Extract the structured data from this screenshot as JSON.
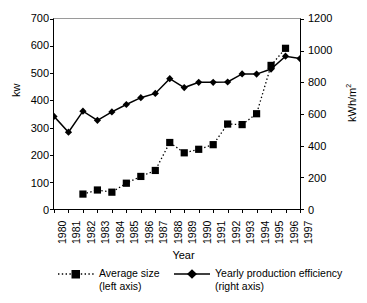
{
  "chart_data": {
    "type": "line",
    "title": "",
    "xlabel": "Year",
    "ylabel": "kw",
    "ylabel_right": "kWh/m2",
    "ylabel_right_base": "kWh/m",
    "ylabel_right_sup": "2",
    "grid": false,
    "legend_position": "bottom",
    "categories": [
      "1980",
      "1981",
      "1982",
      "1983",
      "1984",
      "1985",
      "1986",
      "1987",
      "1988",
      "1989",
      "1990",
      "1991",
      "1992",
      "1993",
      "1994",
      "1995",
      "1996",
      "1997"
    ],
    "x": [
      1980,
      1981,
      1982,
      1983,
      1984,
      1985,
      1986,
      1987,
      1988,
      1989,
      1990,
      1991,
      1992,
      1993,
      1994,
      1995,
      1996,
      1997
    ],
    "ylim": [
      0,
      700
    ],
    "yticks": [
      0,
      100,
      200,
      300,
      400,
      500,
      600,
      700
    ],
    "ylim_right": [
      0,
      1200
    ],
    "yticks_right": [
      0,
      200,
      400,
      600,
      800,
      1000,
      1200
    ],
    "series": [
      {
        "name": "Average size",
        "axis": "left",
        "axis_note": "(left axis)",
        "marker": "square",
        "linestyle": "dotted",
        "color": "#000000",
        "x": [
          1982,
          1983,
          1984,
          1985,
          1986,
          1987,
          1988,
          1989,
          1990,
          1991,
          1992,
          1993,
          1994,
          1995,
          1996
        ],
        "values": [
          55,
          70,
          62,
          95,
          120,
          142,
          245,
          207,
          220,
          237,
          313,
          311,
          351,
          529,
          592
        ]
      },
      {
        "name": "Yearly production efficiency",
        "axis": "right",
        "axis_note": "(right axis)",
        "marker": "diamond",
        "linestyle": "solid",
        "color": "#000000",
        "x": [
          1980,
          1981,
          1982,
          1983,
          1984,
          1985,
          1986,
          1987,
          1988,
          1989,
          1990,
          1991,
          1992,
          1993,
          1994,
          1995,
          1996,
          1997
        ],
        "values": [
          585,
          485,
          618,
          560,
          613,
          660,
          703,
          730,
          823,
          767,
          800,
          800,
          802,
          853,
          852,
          884,
          965,
          950
        ],
        "values_left_scale": [
          341,
          283,
          360,
          327,
          357,
          385,
          410,
          426,
          480,
          447,
          467,
          467,
          468,
          497,
          497,
          516,
          563,
          554
        ]
      }
    ]
  }
}
